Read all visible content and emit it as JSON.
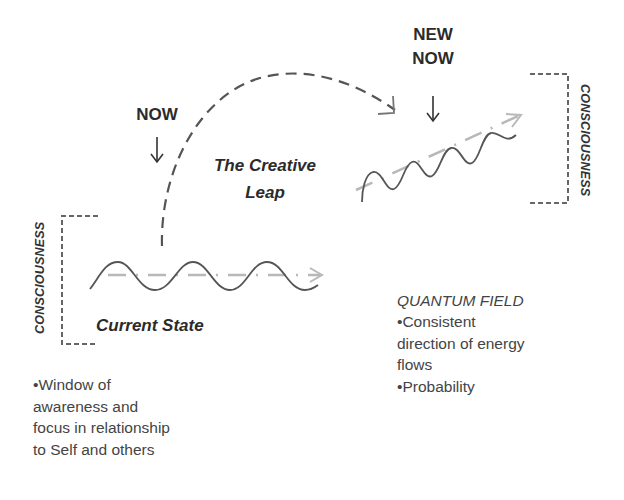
{
  "labels": {
    "now": "NOW",
    "new_now_line1": "NEW",
    "new_now_line2": "NOW",
    "creative_leap_line1": "The Creative",
    "creative_leap_line2": "Leap",
    "current_state": "Current State",
    "consciousness_left": "CONSCIOUSNESS",
    "consciousness_right": "CONSCIOUSNESS"
  },
  "left_notes": {
    "lines": [
      "•Window of",
      "awareness and",
      "focus in relationship",
      "to Self and others"
    ]
  },
  "quantum_field": {
    "title": "QUANTUM FIELD",
    "lines": [
      "•Consistent",
      "direction of energy",
      "flows",
      "•Probability"
    ]
  },
  "colors": {
    "line": "#555555",
    "faded_arrow": "#b0b0b0",
    "text": "#333333"
  }
}
